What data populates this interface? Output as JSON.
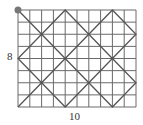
{
  "diagram": {
    "grid_cols": 10,
    "grid_rows": 8,
    "height_label": "8",
    "width_label": "10",
    "path_points": [
      [
        0,
        0
      ],
      [
        8,
        8
      ],
      [
        10,
        6
      ],
      [
        4,
        0
      ],
      [
        0,
        4
      ],
      [
        4,
        8
      ],
      [
        10,
        2
      ],
      [
        8,
        0
      ],
      [
        0,
        8
      ]
    ],
    "start_point": [
      0,
      0
    ],
    "grid_color": "#666666",
    "path_color": "#555555",
    "dot_color": "#777777"
  }
}
